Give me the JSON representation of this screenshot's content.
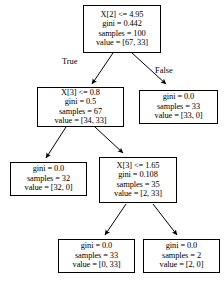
{
  "diagram": {
    "type": "decision-tree",
    "edge_labels": {
      "true": "True",
      "false": "False"
    },
    "nodes": [
      {
        "id": "root",
        "lines": [
          "X[2] <= 4.95",
          "gini = 0.442",
          "samples = 100",
          "value = [67, 33]"
        ],
        "condition": "X[2] <= 4.95",
        "gini": "gini = 0.442",
        "samples": "samples = 100",
        "value": "value = [67, 33]"
      },
      {
        "id": "left1",
        "lines": [
          "X[3] <= 0.8",
          "gini = 0.5",
          "samples = 67",
          "value = [34, 33]"
        ],
        "condition": "X[3] <= 0.8",
        "gini": "gini = 0.5",
        "samples": "samples = 67",
        "value": "value = [34, 33]"
      },
      {
        "id": "right1",
        "lines": [
          "gini = 0.0",
          "samples = 33",
          "value = [33, 0]"
        ],
        "gini": "gini = 0.0",
        "samples": "samples = 33",
        "value": "value = [33, 0]"
      },
      {
        "id": "left2",
        "lines": [
          "gini = 0.0",
          "samples = 32",
          "value = [32, 0]"
        ],
        "gini": "gini = 0.0",
        "samples": "samples = 32",
        "value": "value = [32, 0]"
      },
      {
        "id": "right2",
        "lines": [
          "X[3] <= 1.65",
          "gini = 0.108",
          "samples = 35",
          "value = [2, 33]"
        ],
        "condition": "X[3] <= 1.65",
        "gini": "gini = 0.108",
        "samples": "samples = 35",
        "value": "value = [2, 33]"
      },
      {
        "id": "leaf1",
        "lines": [
          "gini = 0.0",
          "samples = 33",
          "value = [0, 33]"
        ],
        "gini": "gini = 0.0",
        "samples": "samples = 33",
        "value": "value = [0, 33]"
      },
      {
        "id": "leaf2",
        "lines": [
          "gini = 0.0",
          "samples = 2",
          "value = [2, 0]"
        ],
        "gini": "gini = 0.0",
        "samples": "samples = 2",
        "value": "value = [2, 0]"
      }
    ]
  }
}
